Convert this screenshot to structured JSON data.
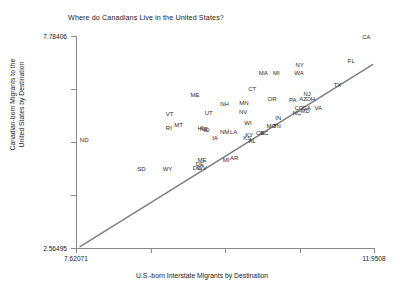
{
  "chart_data": {
    "type": "scatter",
    "title": "Where do Canadians Live in the United States?",
    "xlabel": "U.S.-born Interstate Migrants by Destination",
    "ylabel_line1": "Canadian-born Migrants to the",
    "ylabel_line2": "United States by Destination",
    "xlim": [
      7.62071,
      11.9508
    ],
    "ylim": [
      2.56495,
      7.78406
    ],
    "xticks": [
      "7.62071",
      "11.9508"
    ],
    "yticks": [
      "7.78406",
      "2.56495"
    ],
    "grid": false,
    "legend": null,
    "marker_style": "text-label",
    "fit_line": {
      "label": "linear fit",
      "color": "#808080",
      "x_start": 7.68,
      "y_start": 2.6,
      "x_end": 11.93,
      "y_end": 7.08
    },
    "points": [
      {
        "label": "CA",
        "x": 11.84,
        "y": 7.75
      },
      {
        "label": "FL",
        "x": 11.62,
        "y": 7.18
      },
      {
        "label": "NY",
        "x": 10.87,
        "y": 7.06
      },
      {
        "label": "WA",
        "x": 10.86,
        "y": 6.88
      },
      {
        "label": "MI",
        "x": 10.53,
        "y": 6.88
      },
      {
        "label": "MA",
        "x": 10.34,
        "y": 6.88
      },
      {
        "label": "TX",
        "x": 11.42,
        "y": 6.58
      },
      {
        "label": "CT",
        "x": 10.18,
        "y": 6.48
      },
      {
        "label": "ME",
        "x": 9.35,
        "y": 6.32
      },
      {
        "label": "NJ",
        "x": 10.98,
        "y": 6.36
      },
      {
        "label": "OH",
        "x": 11.03,
        "y": 6.23
      },
      {
        "label": "AZ",
        "x": 10.92,
        "y": 6.24
      },
      {
        "label": "PA",
        "x": 10.77,
        "y": 6.22
      },
      {
        "label": "OR",
        "x": 10.47,
        "y": 6.24
      },
      {
        "label": "MN",
        "x": 10.06,
        "y": 6.14
      },
      {
        "label": "NH",
        "x": 9.78,
        "y": 6.11
      },
      {
        "label": "VA",
        "x": 11.14,
        "y": 6.02
      },
      {
        "label": "CO",
        "x": 10.86,
        "y": 6.01
      },
      {
        "label": "GA",
        "x": 10.97,
        "y": 6.0
      },
      {
        "label": "MD",
        "x": 10.95,
        "y": 5.93
      },
      {
        "label": "NC",
        "x": 10.83,
        "y": 5.88
      },
      {
        "label": "NV",
        "x": 10.05,
        "y": 5.92
      },
      {
        "label": "UT",
        "x": 9.55,
        "y": 5.9
      },
      {
        "label": "VT",
        "x": 8.98,
        "y": 5.86
      },
      {
        "label": "IN",
        "x": 10.56,
        "y": 5.77
      },
      {
        "label": "WI",
        "x": 10.12,
        "y": 5.64
      },
      {
        "label": "MO",
        "x": 10.46,
        "y": 5.57
      },
      {
        "label": "TN",
        "x": 10.54,
        "y": 5.57
      },
      {
        "label": "MT",
        "x": 9.11,
        "y": 5.59
      },
      {
        "label": "RI",
        "x": 8.97,
        "y": 5.52
      },
      {
        "label": "HI",
        "x": 9.43,
        "y": 5.53
      },
      {
        "label": "NE",
        "x": 9.48,
        "y": 5.5
      },
      {
        "label": "ID",
        "x": 9.52,
        "y": 5.46
      },
      {
        "label": "NM",
        "x": 9.78,
        "y": 5.41
      },
      {
        "label": "LA",
        "x": 9.91,
        "y": 5.42
      },
      {
        "label": "OK",
        "x": 10.3,
        "y": 5.4
      },
      {
        "label": "SC",
        "x": 10.36,
        "y": 5.39
      },
      {
        "label": "KY",
        "x": 10.14,
        "y": 5.35
      },
      {
        "label": "KS",
        "x": 10.11,
        "y": 5.28
      },
      {
        "label": "AL",
        "x": 10.18,
        "y": 5.2
      },
      {
        "label": "IA",
        "x": 9.64,
        "y": 5.27
      },
      {
        "label": "ND",
        "x": 7.74,
        "y": 5.22
      },
      {
        "label": "AR",
        "x": 9.92,
        "y": 4.78
      },
      {
        "label": "MI",
        "x": 9.8,
        "y": 4.72
      },
      {
        "label": "ME",
        "x": 9.45,
        "y": 4.72
      },
      {
        "label": "DE",
        "x": 9.42,
        "y": 4.64
      },
      {
        "label": "WV",
        "x": 9.45,
        "y": 4.54
      },
      {
        "label": "DC",
        "x": 9.38,
        "y": 4.53
      },
      {
        "label": "WY",
        "x": 8.95,
        "y": 4.52
      },
      {
        "label": "SD",
        "x": 8.57,
        "y": 4.52
      }
    ]
  }
}
